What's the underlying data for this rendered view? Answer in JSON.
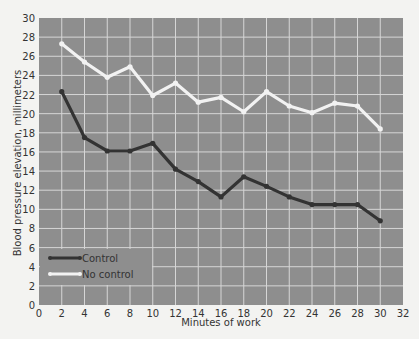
{
  "chart_data": {
    "type": "line",
    "title": "",
    "xlabel": "Minutes of work",
    "ylabel": "Blood pressure elevation, millimeters",
    "xlim": [
      0,
      32
    ],
    "ylim": [
      0,
      30
    ],
    "x_ticks": [
      0,
      2,
      4,
      6,
      8,
      10,
      12,
      14,
      16,
      18,
      20,
      22,
      24,
      26,
      28,
      30,
      32
    ],
    "y_ticks": [
      0,
      2,
      4,
      6,
      8,
      10,
      12,
      14,
      16,
      18,
      20,
      22,
      24,
      26,
      28,
      30
    ],
    "grid": true,
    "legend_position": "lower left",
    "x": [
      2,
      4,
      6,
      8,
      10,
      12,
      14,
      16,
      18,
      20,
      22,
      24,
      26,
      28,
      30
    ],
    "series": [
      {
        "name": "Control",
        "color": "#333333",
        "values": [
          22.3,
          17.5,
          16.1,
          16.1,
          16.9,
          14.2,
          12.9,
          11.3,
          13.4,
          12.4,
          11.3,
          10.5,
          10.5,
          10.5,
          8.8
        ]
      },
      {
        "name": "No control",
        "color": "#f2f2f2",
        "values": [
          27.3,
          25.4,
          23.8,
          24.9,
          21.9,
          23.2,
          21.2,
          21.7,
          20.2,
          22.3,
          20.8,
          20.1,
          21.1,
          20.8,
          18.4
        ]
      }
    ]
  },
  "style": {
    "plot_bg": "#8e8e8e",
    "grid_color": "#d6d6d6",
    "page_bg": "#f3f3f1"
  }
}
